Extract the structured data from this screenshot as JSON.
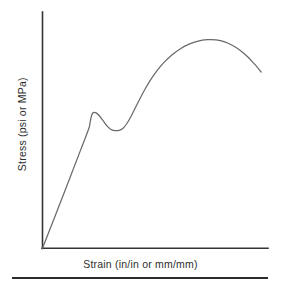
{
  "figure": {
    "kind": "stress-strain-diagram",
    "background_color": "#ffffff",
    "axis_color": "#333333",
    "curve_color": "#6a6a6a",
    "rule_color": "#2b2b2b",
    "label_color": "#2e2e2e"
  },
  "axes": {
    "x_label": "Strain (in/in or mm/mm)",
    "y_label": "Stress (psi or MPa)"
  },
  "footer": {
    "rule_present": "true"
  },
  "chart_data": {
    "type": "line",
    "title": "",
    "subtitle": "",
    "xlabel": "Strain (in/in or mm/mm)",
    "ylabel": "Stress (psi or MPa)",
    "grid": "false",
    "legend": "none",
    "tick_labels_x": [],
    "tick_labels_y": [],
    "xlim": [
      0,
      1
    ],
    "ylim": [
      0,
      1
    ],
    "annotations": [],
    "series": [
      {
        "name": "Engineering stress-strain curve",
        "color": "#6a6a6a",
        "comment": "Normalized coordinates: x 0..1 across the strain axis, y 0..1 up the stress axis. Mild-steel tensile response: linear elastic rise, upper yield peak, lower yield trough, strain hardening to ultimate tensile strength, then necking.",
        "points": [
          [
            0.0,
            0.0
          ],
          [
            0.1,
            0.258
          ],
          [
            0.17,
            0.441
          ],
          [
            0.205,
            0.533
          ],
          [
            0.212,
            0.566
          ],
          [
            0.218,
            0.593
          ],
          [
            0.225,
            0.605
          ],
          [
            0.238,
            0.604
          ],
          [
            0.252,
            0.591
          ],
          [
            0.268,
            0.57
          ],
          [
            0.285,
            0.547
          ],
          [
            0.302,
            0.531
          ],
          [
            0.32,
            0.525
          ],
          [
            0.34,
            0.526
          ],
          [
            0.356,
            0.534
          ],
          [
            0.372,
            0.553
          ],
          [
            0.39,
            0.583
          ],
          [
            0.41,
            0.623
          ],
          [
            0.432,
            0.667
          ],
          [
            0.455,
            0.71
          ],
          [
            0.48,
            0.752
          ],
          [
            0.508,
            0.792
          ],
          [
            0.54,
            0.83
          ],
          [
            0.575,
            0.863
          ],
          [
            0.612,
            0.89
          ],
          [
            0.65,
            0.91
          ],
          [
            0.69,
            0.924
          ],
          [
            0.73,
            0.93
          ],
          [
            0.77,
            0.929
          ],
          [
            0.808,
            0.92
          ],
          [
            0.845,
            0.903
          ],
          [
            0.88,
            0.88
          ],
          [
            0.912,
            0.852
          ],
          [
            0.935,
            0.827
          ],
          [
            0.952,
            0.808
          ],
          [
            0.963,
            0.794
          ],
          [
            0.97,
            0.786
          ]
        ],
        "key_features": {
          "proportional_limit": [
            0.195,
            0.515
          ],
          "upper_yield_point": [
            0.227,
            0.606
          ],
          "lower_yield_point": [
            0.322,
            0.525
          ],
          "ultimate_tensile_strength": [
            0.74,
            0.93
          ],
          "fracture_end": [
            0.97,
            0.786
          ]
        }
      }
    ]
  }
}
